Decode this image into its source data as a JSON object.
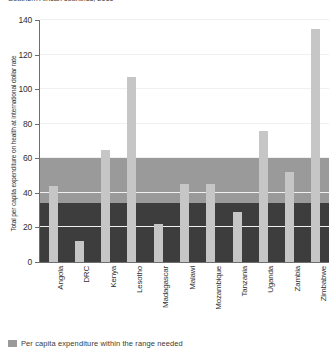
{
  "chart_data": {
    "type": "bar",
    "title": "Southern African countries, 2010",
    "xlabel": "",
    "ylabel": "Total per capita expenditure on health at international dollar rate",
    "ylim": [
      0,
      140
    ],
    "yticks": [
      0,
      20,
      40,
      60,
      80,
      100,
      120,
      140
    ],
    "grid": true,
    "legend_position": "bottom-left",
    "categories": [
      "Angola",
      "DRC",
      "Kenya",
      "Lesotho",
      "Madagascar",
      "Malawi",
      "Mozambique",
      "Tanzania",
      "Uganda",
      "Zambia",
      "Zimbabwe"
    ],
    "series": [
      {
        "name": "Total per capita expenditure on health",
        "values": [
          44,
          12,
          65,
          107,
          22,
          45,
          45,
          29,
          76,
          52,
          135
        ]
      }
    ],
    "bands": [
      {
        "name": "Per capita expenditure within the range needed",
        "from": 34,
        "to": 60,
        "color": "#9a9a9a"
      },
      {
        "name": "Per capita expenditure below the range needed",
        "from": 0,
        "to": 34,
        "color": "#3d3d3d"
      }
    ],
    "legend": [
      {
        "label": "Per capita expenditure within the range needed",
        "color": "#9a9a9a"
      }
    ],
    "colors": {
      "bar": "#c6c6c6",
      "band_upper": "#9a9a9a",
      "band_lower": "#3d3d3d",
      "axis": "#6e6e6e",
      "background": "#ffffff"
    }
  }
}
